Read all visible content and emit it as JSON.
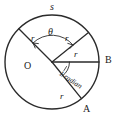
{
  "figure": {
    "geometry": {
      "center": {
        "x": 52,
        "y": 62
      },
      "radius": 47,
      "stroke_color": "#2b2b2b",
      "background_color": "#ffffff"
    },
    "labels": {
      "arc_s": "s",
      "angle_theta": "θ",
      "radius_upper_left": "r",
      "radius_upper_right": "r",
      "radius_to_b": "r",
      "radius_to_a": "r",
      "center_point": "O",
      "point_b": "B",
      "point_a": "A",
      "one_radian": "1 radian"
    }
  }
}
